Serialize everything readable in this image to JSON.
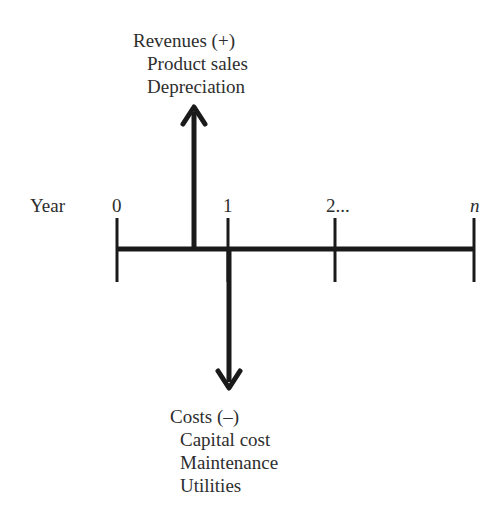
{
  "diagram": {
    "type": "cash-flow-timeline",
    "axis_label": "Year",
    "ticks": [
      {
        "label": "0",
        "italic": false
      },
      {
        "label": "1",
        "italic": false
      },
      {
        "label": "2...",
        "italic": false
      },
      {
        "label": "n",
        "italic": true
      }
    ],
    "revenues": {
      "heading": "Revenues (+)",
      "items": [
        "Product sales",
        "Depreciation"
      ],
      "direction": "up"
    },
    "costs": {
      "heading": "Costs (–)",
      "items": [
        "Capital cost",
        "Maintenance",
        "Utilities"
      ],
      "direction": "down"
    },
    "colors": {
      "line": "#1a1a1a",
      "text": "#2e2e2e",
      "background": "#ffffff"
    }
  }
}
